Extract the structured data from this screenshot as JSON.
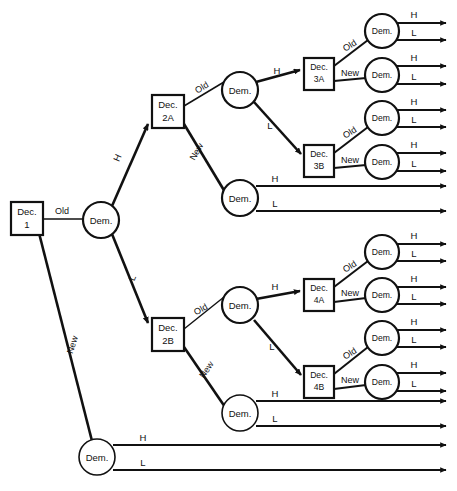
{
  "diagram": {
    "type": "decision-tree",
    "colors": {
      "stroke": "#111111",
      "background": "#ffffff",
      "node_fill": "#ffffff"
    },
    "labels": {
      "decision_1": "Dec.\n1",
      "decision_1_line1": "Dec.",
      "decision_1_line2": "1",
      "decision_2a_line1": "Dec.",
      "decision_2a_line2": "2A",
      "decision_2b_line1": "Dec.",
      "decision_2b_line2": "2B",
      "decision_3a_line1": "Dec.",
      "decision_3a_line2": "3A",
      "decision_3b_line1": "Dec.",
      "decision_3b_line2": "3B",
      "decision_4a_line1": "Dec.",
      "decision_4a_line2": "4A",
      "decision_4b_line1": "Dec.",
      "decision_4b_line2": "4B",
      "chance": "Dem.",
      "branch_old": "Old",
      "branch_new": "New",
      "branch_high": "H",
      "branch_low": "L"
    },
    "decision_nodes": [
      {
        "id": "dec1",
        "line1": "Dec.",
        "line2": "1",
        "x": 11,
        "y": 202,
        "w": 32,
        "h": 33
      },
      {
        "id": "dec2a",
        "line1": "Dec.",
        "line2": "2A",
        "x": 152,
        "y": 95,
        "w": 32,
        "h": 33
      },
      {
        "id": "dec2b",
        "line1": "Dec.",
        "line2": "2B",
        "x": 152,
        "y": 318,
        "w": 32,
        "h": 33
      },
      {
        "id": "dec3a",
        "line1": "Dec.",
        "line2": "3A",
        "x": 304,
        "y": 58,
        "w": 30,
        "h": 32
      },
      {
        "id": "dec3b",
        "line1": "Dec.",
        "line2": "3B",
        "x": 304,
        "y": 145,
        "w": 30,
        "h": 32
      },
      {
        "id": "dec4a",
        "line1": "Dec.",
        "line2": "4A",
        "x": 304,
        "y": 279,
        "w": 30,
        "h": 32
      },
      {
        "id": "dec4b",
        "line1": "Dec.",
        "line2": "4B",
        "x": 304,
        "y": 366,
        "w": 30,
        "h": 32
      }
    ],
    "chance_nodes": [
      {
        "id": "dem-root",
        "label": "Dem.",
        "cx": 101,
        "cy": 220,
        "r": 18
      },
      {
        "id": "dem-2a-old",
        "label": "Dem.",
        "cx": 240,
        "cy": 90,
        "r": 18
      },
      {
        "id": "dem-2a-new",
        "label": "Dem.",
        "cx": 240,
        "cy": 198,
        "r": 18
      },
      {
        "id": "dem-2b-old",
        "label": "Dem.",
        "cx": 240,
        "cy": 305,
        "r": 18
      },
      {
        "id": "dem-2b-new",
        "label": "Dem.",
        "cx": 240,
        "cy": 413,
        "r": 18
      },
      {
        "id": "dem-dec1-new",
        "label": "Dem.",
        "cx": 97,
        "cy": 457,
        "r": 18
      },
      {
        "id": "dem-3a-old",
        "label": "Dem.",
        "cx": 382,
        "cy": 31,
        "r": 17
      },
      {
        "id": "dem-3a-new",
        "label": "Dem.",
        "cx": 382,
        "cy": 75,
        "r": 17
      },
      {
        "id": "dem-3b-old",
        "label": "Dem.",
        "cx": 382,
        "cy": 118,
        "r": 17
      },
      {
        "id": "dem-3b-new",
        "label": "Dem.",
        "cx": 382,
        "cy": 162,
        "r": 17
      },
      {
        "id": "dem-4a-old",
        "label": "Dem.",
        "cx": 382,
        "cy": 252,
        "r": 17
      },
      {
        "id": "dem-4a-new",
        "label": "Dem.",
        "cx": 382,
        "cy": 295,
        "r": 17
      },
      {
        "id": "dem-4b-old",
        "label": "Dem.",
        "cx": 382,
        "cy": 338,
        "r": 17
      },
      {
        "id": "dem-4b-new",
        "label": "Dem.",
        "cx": 382,
        "cy": 382,
        "r": 17
      }
    ],
    "structure": {
      "root": "dec1",
      "branches": [
        {
          "from": "dec1",
          "label": "Old",
          "to": "dem-root"
        },
        {
          "from": "dec1",
          "label": "New",
          "to": "dem-dec1-new"
        },
        {
          "from": "dem-root",
          "label": "H",
          "to": "dec2a"
        },
        {
          "from": "dem-root",
          "label": "L",
          "to": "dec2b"
        },
        {
          "from": "dec2a",
          "label": "Old",
          "to": "dem-2a-old"
        },
        {
          "from": "dec2a",
          "label": "New",
          "to": "dem-2a-new"
        },
        {
          "from": "dem-2a-old",
          "label": "H",
          "to": "dec3a"
        },
        {
          "from": "dem-2a-old",
          "label": "L",
          "to": "dec3b"
        },
        {
          "from": "dec3a",
          "label": "Old",
          "to": "dem-3a-old"
        },
        {
          "from": "dec3a",
          "label": "New",
          "to": "dem-3a-new"
        },
        {
          "from": "dec3b",
          "label": "Old",
          "to": "dem-3b-old"
        },
        {
          "from": "dec3b",
          "label": "New",
          "to": "dem-3b-new"
        },
        {
          "from": "dec2b",
          "label": "Old",
          "to": "dem-2b-old"
        },
        {
          "from": "dec2b",
          "label": "New",
          "to": "dem-2b-new"
        },
        {
          "from": "dem-2b-old",
          "label": "H",
          "to": "dec4a"
        },
        {
          "from": "dem-2b-old",
          "label": "L",
          "to": "dec4b"
        },
        {
          "from": "dec4a",
          "label": "Old",
          "to": "dem-4a-old"
        },
        {
          "from": "dec4a",
          "label": "New",
          "to": "dem-4a-new"
        },
        {
          "from": "dec4b",
          "label": "Old",
          "to": "dem-4b-old"
        },
        {
          "from": "dec4b",
          "label": "New",
          "to": "dem-4b-new"
        }
      ],
      "terminal_pairs": [
        {
          "node": "dem-3a-old",
          "high": "H",
          "low": "L"
        },
        {
          "node": "dem-3a-new",
          "high": "H",
          "low": "L"
        },
        {
          "node": "dem-3b-old",
          "high": "H",
          "low": "L"
        },
        {
          "node": "dem-3b-new",
          "high": "H",
          "low": "L"
        },
        {
          "node": "dem-2a-new",
          "high": "H",
          "low": "L"
        },
        {
          "node": "dem-4a-old",
          "high": "H",
          "low": "L"
        },
        {
          "node": "dem-4a-new",
          "high": "H",
          "low": "L"
        },
        {
          "node": "dem-4b-old",
          "high": "H",
          "low": "L"
        },
        {
          "node": "dem-4b-new",
          "high": "H",
          "low": "L"
        },
        {
          "node": "dem-2b-new",
          "high": "H",
          "low": "L"
        },
        {
          "node": "dem-dec1-new",
          "high": "H",
          "low": "L"
        }
      ]
    },
    "edge_labels": {
      "dec1_old": "Old",
      "dec1_new": "New",
      "root_h": "H",
      "root_l": "L",
      "dec2a_old": "Old",
      "dec2a_new": "New",
      "dem2aold_h": "H",
      "dem2aold_l": "L",
      "dec3a_old": "Old",
      "dec3a_new": "New",
      "dec3b_old": "Old",
      "dec3b_new": "New",
      "dec2b_old": "Old",
      "dec2b_new": "New",
      "dem2bold_h": "H",
      "dem2bold_l": "L",
      "dec4a_old": "Old",
      "dec4a_new": "New",
      "dec4b_old": "Old",
      "dec4b_new": "New",
      "t1_h": "H",
      "t1_l": "L",
      "t2_h": "H",
      "t2_l": "L",
      "t3_h": "H",
      "t3_l": "L",
      "t4_h": "H",
      "t4_l": "L",
      "t5_h": "H",
      "t5_l": "L",
      "t6_h": "H",
      "t6_l": "L",
      "t7_h": "H",
      "t7_l": "L",
      "t8_h": "H",
      "t8_l": "L",
      "t9_h": "H",
      "t9_l": "L",
      "t10_h": "H",
      "t10_l": "L",
      "t11_h": "H",
      "t11_l": "L"
    }
  }
}
